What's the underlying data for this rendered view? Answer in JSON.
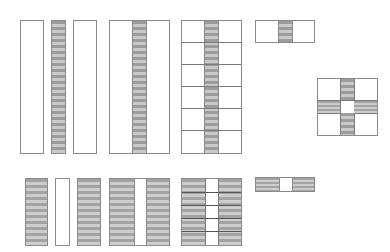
{
  "diagram": {
    "colors": {
      "border": "#8a8a8a",
      "stripe_dark": "#9c9c9c",
      "stripe_light": "#c8c8c8",
      "background": "#ffffff"
    },
    "top_row": [
      {
        "id": "white-strip-wide-1",
        "fill": "white"
      },
      {
        "id": "striped-strip-narrow",
        "fill": "striped"
      },
      {
        "id": "white-strip-wide-2",
        "fill": "white"
      },
      {
        "id": "white-block-with-striped-center",
        "fill": "white+striped-center"
      },
      {
        "id": "grid-6-rows-striped-center",
        "rows": 6,
        "fill": "white+striped-center"
      },
      {
        "id": "single-row-striped-center",
        "rows": 1,
        "fill": "white+striped-center"
      },
      {
        "id": "cross-pattern",
        "rows": 3,
        "fill": "white corners, striped cross, white center"
      }
    ],
    "bottom_row": [
      {
        "id": "striped-strip-wide-1",
        "fill": "striped"
      },
      {
        "id": "white-strip-narrow",
        "fill": "white"
      },
      {
        "id": "striped-strip-wide-2",
        "fill": "striped"
      },
      {
        "id": "striped-block-with-white-center",
        "fill": "striped+white-center"
      },
      {
        "id": "grid-5-rows-white-center",
        "rows": 5,
        "fill": "striped+white-center"
      },
      {
        "id": "single-row-white-center",
        "rows": 1,
        "fill": "striped+white-center"
      }
    ]
  }
}
